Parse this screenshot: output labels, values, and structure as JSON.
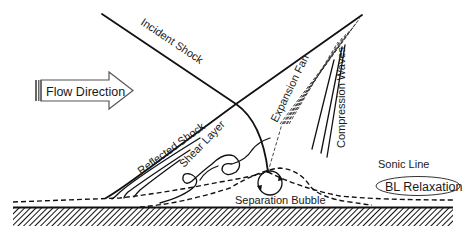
{
  "diagram": {
    "type": "shock-wave boundary-layer interaction schematic",
    "labels": {
      "flow_direction": "Flow Direction",
      "incident_shock": "Incident Shock",
      "reflected_shock": "Reflected Shock",
      "expansion_fan": "Expansion Fan",
      "compression_waves": "Compression Waves",
      "shear_layer": "Shear Layer",
      "sonic_line": "Sonic Line",
      "bl_relaxation": "BL Relaxation",
      "separation_bubble": "Separation Bubble"
    },
    "colors": {
      "line": "#111111",
      "background": "#ffffff",
      "wall_hatch": "#111111"
    }
  }
}
